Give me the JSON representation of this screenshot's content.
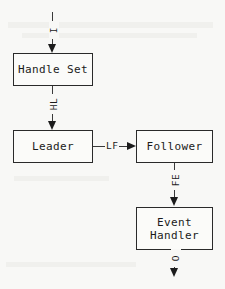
{
  "diagram": {
    "type": "flowchart",
    "background_color": "#f8f8f6",
    "stroke_color": "#2a2a2a",
    "nodes": [
      {
        "id": "handle_set",
        "label": "Handle Set",
        "x": 13,
        "y": 53,
        "w": 80,
        "h": 33
      },
      {
        "id": "leader",
        "id_label": "Leader",
        "label": "Leader",
        "x": 13,
        "y": 130,
        "w": 80,
        "h": 33
      },
      {
        "id": "follower",
        "label": "Follower",
        "x": 136,
        "y": 130,
        "w": 77,
        "h": 33
      },
      {
        "id": "event_handler",
        "label": "Event\nHandler",
        "x": 136,
        "y": 207,
        "w": 77,
        "h": 43
      }
    ],
    "edges": [
      {
        "id": "input_to_handle_set",
        "label": "I",
        "orientation": "vertical",
        "from": "(entry)",
        "to": "handle_set"
      },
      {
        "id": "handle_set_to_leader",
        "label": "HL",
        "orientation": "vertical",
        "from": "handle_set",
        "to": "leader"
      },
      {
        "id": "leader_to_follower",
        "label": "LF",
        "orientation": "horizontal",
        "from": "leader",
        "to": "follower"
      },
      {
        "id": "follower_to_event_handler",
        "label": "FE",
        "orientation": "vertical",
        "from": "follower",
        "to": "event_handler"
      },
      {
        "id": "event_handler_to_output",
        "label": "O",
        "orientation": "vertical",
        "from": "event_handler",
        "to": "(exit)"
      }
    ]
  }
}
